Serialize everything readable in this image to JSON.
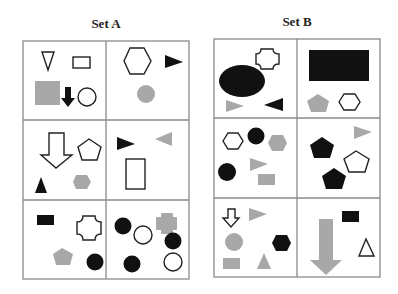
{
  "set_a": {
    "title": "Set A",
    "cells": [
      {
        "row": 1,
        "col": 1,
        "shapes": [
          "outline down triangle",
          "outline rectangle",
          "gray square",
          "black down arrow",
          "outline circle"
        ]
      },
      {
        "row": 1,
        "col": 2,
        "shapes": [
          "outline hexagon",
          "black right triangle",
          "gray circle"
        ]
      },
      {
        "row": 2,
        "col": 1,
        "shapes": [
          "outline down arrow",
          "outline pentagon",
          "black triangle",
          "gray hexagon"
        ]
      },
      {
        "row": 2,
        "col": 2,
        "shapes": [
          "black right triangle",
          "gray left triangle",
          "outline tall rectangle"
        ]
      },
      {
        "row": 3,
        "col": 1,
        "shapes": [
          "black rectangle",
          "outline cross",
          "gray pentagon",
          "black circle"
        ]
      },
      {
        "row": 3,
        "col": 2,
        "shapes": [
          "black circle",
          "outline circle",
          "gray cross",
          "black circle",
          "black circle",
          "outline circle"
        ]
      }
    ]
  },
  "set_b": {
    "title": "Set B",
    "cells": [
      {
        "row": 1,
        "col": 1,
        "shapes": [
          "outline cross",
          "black ellipse",
          "gray right triangle",
          "black left triangle"
        ]
      },
      {
        "row": 1,
        "col": 2,
        "shapes": [
          "black large rectangle",
          "gray pentagon",
          "outline hexagon"
        ]
      },
      {
        "row": 2,
        "col": 1,
        "shapes": [
          "outline hexagon",
          "black circle",
          "gray hexagon",
          "black circle",
          "gray right triangle",
          "gray rectangle"
        ]
      },
      {
        "row": 2,
        "col": 2,
        "shapes": [
          "gray right triangle",
          "black pentagon",
          "outline pentagon",
          "black pentagon"
        ]
      },
      {
        "row": 3,
        "col": 1,
        "shapes": [
          "outline down arrow",
          "gray right triangle",
          "gray circle",
          "black hexagon",
          "gray rectangle",
          "gray triangle"
        ]
      },
      {
        "row": 3,
        "col": 2,
        "shapes": [
          "gray down arrow",
          "black rectangle",
          "outline triangle"
        ]
      }
    ]
  },
  "colors": {
    "black": "#111111",
    "gray": "#a8a8a8",
    "grid": "#8a8a8a",
    "outline": "#222222"
  }
}
